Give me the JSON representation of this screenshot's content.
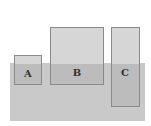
{
  "diagram": {
    "water": {
      "left": 10,
      "top": 63,
      "width": 135,
      "height": 58,
      "color": "#c9c9c9"
    },
    "blocks": [
      {
        "label": "A",
        "left": 14,
        "top": 55,
        "width": 28,
        "height": 30
      },
      {
        "label": "B",
        "left": 50,
        "top": 27,
        "width": 54,
        "height": 58
      },
      {
        "label": "C",
        "left": 111,
        "top": 27,
        "width": 29,
        "height": 80
      }
    ]
  }
}
